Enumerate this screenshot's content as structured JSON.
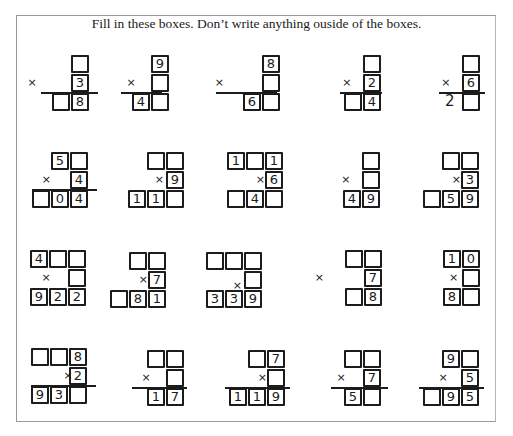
{
  "instructions": "Fill in these boxes.  Don’t write anything ouside of the boxes.",
  "multiply_symbol": "×",
  "problems": [
    {
      "id": 1,
      "row": 1,
      "top": [
        "",
        null
      ],
      "mult": [
        "3"
      ],
      "product": [
        "",
        "8"
      ],
      "product_loose": []
    },
    {
      "id": 2,
      "row": 1,
      "top": [
        "9"
      ],
      "mult": [
        ""
      ],
      "product": [
        "4",
        ""
      ]
    },
    {
      "id": 3,
      "row": 1,
      "top": [
        "8"
      ],
      "mult": [
        ""
      ],
      "product": [
        "6",
        ""
      ]
    },
    {
      "id": 4,
      "row": 1,
      "top": [
        ""
      ],
      "mult": [
        "2"
      ],
      "product": [
        "",
        "4"
      ]
    },
    {
      "id": 5,
      "row": 1,
      "top": [
        ""
      ],
      "mult": [
        "6"
      ],
      "product": [
        ""
      ],
      "product_loose": [
        "2"
      ]
    },
    {
      "id": 6,
      "row": 2,
      "top": [
        "5",
        ""
      ],
      "mult": [
        "4"
      ],
      "product": [
        "",
        "0",
        "4"
      ]
    },
    {
      "id": 7,
      "row": 2,
      "top": [
        "",
        ""
      ],
      "mult": [
        "9"
      ],
      "product": [
        "1",
        "1",
        ""
      ]
    },
    {
      "id": 8,
      "row": 2,
      "top": [
        "1",
        "",
        "1"
      ],
      "mult": [
        "6"
      ],
      "product": [
        "",
        "4",
        ""
      ]
    },
    {
      "id": 9,
      "row": 2,
      "top": [
        ""
      ],
      "mult": [
        ""
      ],
      "product": [
        "4",
        "9"
      ]
    },
    {
      "id": 10,
      "row": 2,
      "top": [
        "",
        ""
      ],
      "mult": [
        "3"
      ],
      "product": [
        "",
        "5",
        "9"
      ]
    },
    {
      "id": 11,
      "row": 3,
      "top": [
        "4",
        "",
        ""
      ],
      "mult": [
        ""
      ],
      "product": [
        "9",
        "2",
        "2"
      ]
    },
    {
      "id": 12,
      "row": 3,
      "top": [
        "",
        ""
      ],
      "mult": [
        "7"
      ],
      "product": [
        "",
        "8",
        "1"
      ]
    },
    {
      "id": 13,
      "row": 3,
      "top": [
        "",
        "",
        ""
      ],
      "mult": [
        ""
      ],
      "product": [
        "3",
        "3",
        "9"
      ]
    },
    {
      "id": 14,
      "row": 3,
      "top": [
        "",
        ""
      ],
      "mult": [
        "7"
      ],
      "product": [
        "",
        "8"
      ]
    },
    {
      "id": 15,
      "row": 3,
      "top": [
        "1",
        "0"
      ],
      "mult": [
        ""
      ],
      "product": [
        "8",
        ""
      ]
    },
    {
      "id": 16,
      "row": 4,
      "top": [
        "",
        "",
        "8"
      ],
      "mult": [
        "2"
      ],
      "product": [
        "9",
        "3",
        ""
      ]
    },
    {
      "id": 17,
      "row": 4,
      "top": [
        "",
        ""
      ],
      "mult": [
        ""
      ],
      "product": [
        "1",
        "7"
      ]
    },
    {
      "id": 18,
      "row": 4,
      "top": [
        "",
        "7"
      ],
      "mult": [
        ""
      ],
      "product": [
        "1",
        "1",
        "9"
      ]
    },
    {
      "id": 19,
      "row": 4,
      "top": [
        "",
        ""
      ],
      "mult": [
        "7"
      ],
      "product": [
        "5",
        ""
      ]
    },
    {
      "id": 20,
      "row": 4,
      "top": [
        "9",
        ""
      ],
      "mult": [
        "5"
      ],
      "product": [
        "",
        "9",
        "5"
      ]
    }
  ]
}
